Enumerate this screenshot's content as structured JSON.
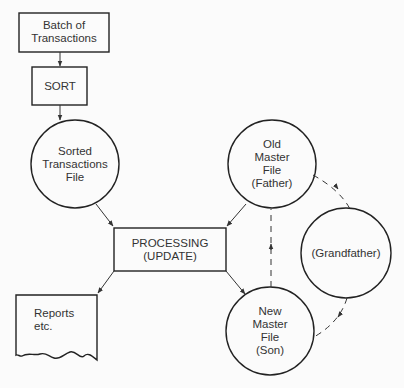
{
  "diagram": {
    "type": "grandfather-father-son file update flowchart",
    "nodes": {
      "batch": {
        "shape": "rectangle",
        "lines": [
          "Batch of",
          "Transactions"
        ]
      },
      "sort": {
        "shape": "rectangle",
        "lines": [
          "SORT"
        ]
      },
      "sorted_file": {
        "shape": "circle",
        "lines": [
          "Sorted",
          "Transactions",
          "File"
        ]
      },
      "processing": {
        "shape": "rectangle",
        "lines": [
          "PROCESSING",
          "(UPDATE)"
        ]
      },
      "old_master": {
        "shape": "circle",
        "lines": [
          "Old",
          "Master",
          "File",
          "(Father)"
        ]
      },
      "grandfather": {
        "shape": "circle",
        "lines": [
          "(Grandfather)"
        ]
      },
      "new_master": {
        "shape": "circle",
        "lines": [
          "New",
          "Master",
          "File",
          "(Son)"
        ]
      },
      "reports": {
        "shape": "document",
        "lines": [
          "Reports",
          "etc."
        ]
      }
    },
    "edges": [
      {
        "from": "batch",
        "to": "sort",
        "style": "solid"
      },
      {
        "from": "sort",
        "to": "sorted_file",
        "style": "solid"
      },
      {
        "from": "sorted_file",
        "to": "processing",
        "style": "solid"
      },
      {
        "from": "old_master",
        "to": "processing",
        "style": "solid"
      },
      {
        "from": "processing",
        "to": "reports",
        "style": "solid"
      },
      {
        "from": "processing",
        "to": "new_master",
        "style": "solid"
      },
      {
        "from": "new_master",
        "to": "old_master",
        "style": "dashed"
      },
      {
        "from": "old_master",
        "to": "grandfather",
        "style": "dashed"
      },
      {
        "from": "grandfather",
        "to": "new_master",
        "style": "dashed"
      }
    ]
  }
}
